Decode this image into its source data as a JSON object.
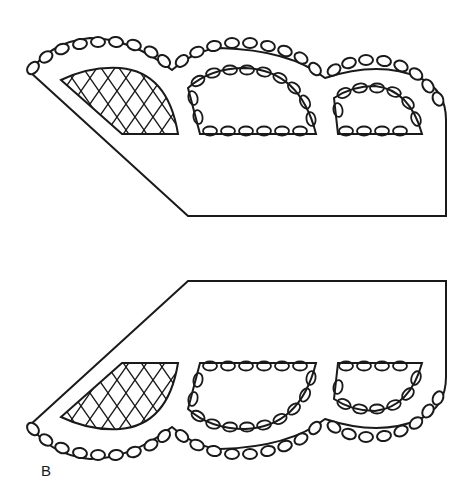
{
  "figure": {
    "label": "B",
    "stroke_color": "#1a1a1a",
    "background": "#ffffff"
  },
  "pieces": [
    {
      "name": "top-piece",
      "windows": [
        "mesh-window",
        "chain-window-large",
        "chain-window-small"
      ]
    },
    {
      "name": "bottom-piece",
      "windows": [
        "mesh-window",
        "chain-window-large",
        "chain-window-small"
      ]
    }
  ]
}
